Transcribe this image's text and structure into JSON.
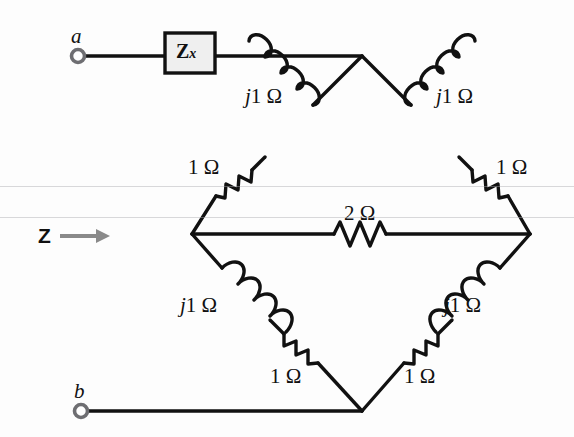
{
  "figure": {
    "type": "circuit-schematic",
    "width": 574,
    "height": 437,
    "background_color": "#fdfdfd",
    "line_color": "#111111"
  },
  "terminals": [
    {
      "id": "a",
      "label": "a",
      "x": 78,
      "y": 56
    },
    {
      "id": "b",
      "label": "b",
      "x": 81,
      "y": 411
    }
  ],
  "input_port": {
    "label": "Z",
    "arrow": "→",
    "arrow_color": "#8a8a8a",
    "x": 38,
    "y": 225
  },
  "blocks": [
    {
      "name": "unknown-impedance",
      "label_main": "Z",
      "label_sub": "x",
      "fill": "#efefef",
      "stroke": "#111111",
      "x": 165,
      "y": 33,
      "width": 50,
      "height": 40
    }
  ],
  "components": [
    {
      "id": "l-top-left",
      "kind": "inductor",
      "label": "j1 Ω",
      "label_x": 245,
      "label_y": 86
    },
    {
      "id": "l-top-right",
      "kind": "inductor",
      "label": "j1 Ω",
      "label_x": 436,
      "label_y": 86
    },
    {
      "id": "r-top-left",
      "kind": "resistor",
      "label": "1 Ω",
      "label_x": 188,
      "label_y": 157
    },
    {
      "id": "r-top-right",
      "kind": "resistor",
      "label": "1 Ω",
      "label_x": 496,
      "label_y": 157
    },
    {
      "id": "r-bridge",
      "kind": "resistor",
      "label": "2 Ω",
      "label_x": 344,
      "label_y": 203
    },
    {
      "id": "l-bottom-left",
      "kind": "inductor",
      "label": "j1 Ω",
      "label_x": 180,
      "label_y": 295
    },
    {
      "id": "l-bottom-right",
      "kind": "inductor",
      "label": "j1 Ω",
      "label_x": 444,
      "label_y": 295
    },
    {
      "id": "r-bottom-left",
      "kind": "resistor",
      "label": "1 Ω",
      "label_x": 270,
      "label_y": 366
    },
    {
      "id": "r-bottom-right",
      "kind": "resistor",
      "label": "1 Ω",
      "label_x": 404,
      "label_y": 366
    }
  ],
  "nodes": {
    "top_apex": {
      "x": 362,
      "y": 56
    },
    "left_mid": {
      "x": 192,
      "y": 234
    },
    "right_mid": {
      "x": 530,
      "y": 234
    },
    "bottom_apex": {
      "x": 362,
      "y": 411
    }
  }
}
